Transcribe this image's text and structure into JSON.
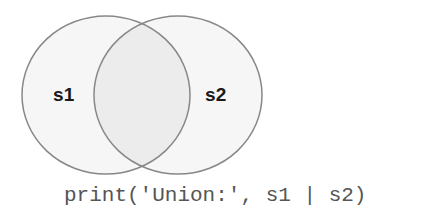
{
  "diagram": {
    "type": "venn",
    "operation": "union",
    "sets": [
      {
        "id": "s1",
        "label": "s1",
        "cx": 106,
        "cy": 95,
        "rx": 84,
        "ry": 79
      },
      {
        "id": "s2",
        "label": "s2",
        "cx": 178,
        "cy": 95,
        "rx": 84,
        "ry": 79
      }
    ],
    "colors": {
      "set_fill": "#f6f6f6",
      "overlap_fill": "#ececec",
      "stroke": "#888888",
      "label_text": "#1a1a1a",
      "code_text": "#555555"
    }
  },
  "code": {
    "line": "print('Union:', s1 | s2)"
  }
}
